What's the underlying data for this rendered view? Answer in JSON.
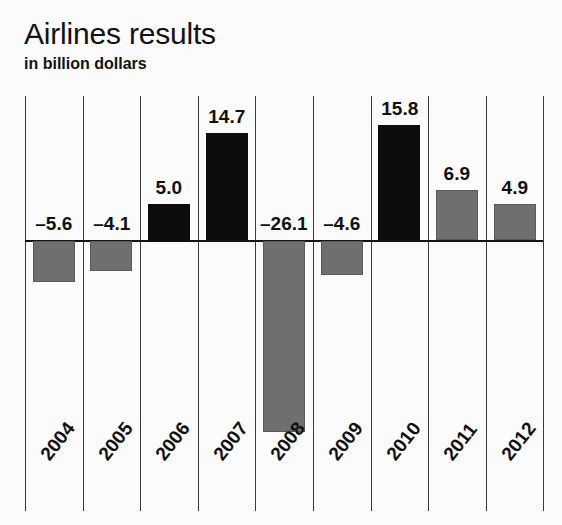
{
  "header": {
    "title": "Airlines results",
    "subtitle": "in billion dollars"
  },
  "colors": {
    "positive_actual": "#0c0c0c",
    "negative": "#6f6f6f",
    "positive_forecast": "#6f6f6f",
    "gridline": "#3a3a3a",
    "zero_line": "#141414",
    "background": "#fbfbfb",
    "text": "#101010"
  },
  "chart_data": {
    "type": "bar",
    "title": "Airlines results",
    "subtitle": "in billion dollars",
    "xlabel": "",
    "ylabel": "in billion dollars",
    "grid": "vertical",
    "legend": "none",
    "ylim": [
      -28.5,
      20.0
    ],
    "zero_baseline": 0,
    "categories": [
      "2004",
      "2005",
      "2006",
      "2007",
      "2008",
      "2009",
      "2010",
      "2011",
      "2012"
    ],
    "values": [
      -5.6,
      -4.1,
      5.0,
      14.7,
      -26.1,
      -4.6,
      15.8,
      6.9,
      4.9
    ],
    "value_labels": [
      "–5.6",
      "–4.1",
      "5.0",
      "14.7",
      "–26.1",
      "–4.6",
      "15.8",
      "6.9",
      "4.9"
    ],
    "bar_styles": [
      "negative",
      "negative",
      "positive_actual",
      "positive_actual",
      "negative",
      "negative",
      "positive_actual",
      "positive_forecast",
      "positive_forecast"
    ],
    "bars": [
      {
        "year": "2004",
        "value": -5.6,
        "label": "–5.6",
        "style": "negative"
      },
      {
        "year": "2005",
        "value": -4.1,
        "label": "–4.1",
        "style": "negative"
      },
      {
        "year": "2006",
        "value": 5.0,
        "label": "5.0",
        "style": "positive_actual"
      },
      {
        "year": "2007",
        "value": 14.7,
        "label": "14.7",
        "style": "positive_actual"
      },
      {
        "year": "2008",
        "value": -26.1,
        "label": "–26.1",
        "style": "negative"
      },
      {
        "year": "2009",
        "value": -4.6,
        "label": "–4.6",
        "style": "negative"
      },
      {
        "year": "2010",
        "value": 15.8,
        "label": "15.8",
        "style": "positive_actual"
      },
      {
        "year": "2011",
        "value": 6.9,
        "label": "6.9",
        "style": "positive_forecast"
      },
      {
        "year": "2012",
        "value": 4.9,
        "label": "4.9",
        "style": "positive_forecast"
      }
    ]
  },
  "geometry": {
    "grid_left": 25,
    "grid_spacing": 57.6,
    "grid_count": 10,
    "grid_top": 96,
    "grid_height": 415,
    "zero_y": 240,
    "px_per_unit": 7.3,
    "bar_width": 42,
    "label_gap": 6,
    "year_label_y": 452,
    "year_label_offset_x": 12
  }
}
